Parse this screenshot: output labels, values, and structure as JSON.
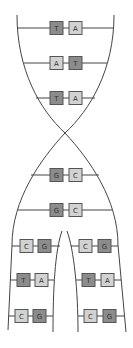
{
  "diagram": {
    "top_pairs": [
      {
        "left": "T",
        "right": "A",
        "left_shade": "dark",
        "right_shade": "light"
      },
      {
        "left": "A",
        "right": "T",
        "left_shade": "light",
        "right_shade": "dark"
      },
      {
        "left": "T",
        "right": "A",
        "left_shade": "dark",
        "right_shade": "light"
      }
    ],
    "middle_pairs": [
      {
        "left": "G",
        "right": "C",
        "left_shade": "dark",
        "right_shade": "light"
      },
      {
        "left": "G",
        "right": "C",
        "left_shade": "dark",
        "right_shade": "light"
      }
    ],
    "left_branch_pairs": [
      {
        "left": "C",
        "right": "G",
        "left_shade": "light",
        "right_shade": "dark"
      },
      {
        "left": "T",
        "right": "A",
        "left_shade": "dark",
        "right_shade": "light"
      },
      {
        "left": "C",
        "right": "G",
        "left_shade": "light",
        "right_shade": "dark"
      }
    ],
    "right_branch_pairs": [
      {
        "left": "C",
        "right": "G",
        "left_shade": "light",
        "right_shade": "dark"
      },
      {
        "left": "T",
        "right": "A",
        "left_shade": "dark",
        "right_shade": "light"
      },
      {
        "left": "C",
        "right": "G",
        "left_shade": "light",
        "right_shade": "dark"
      }
    ]
  }
}
